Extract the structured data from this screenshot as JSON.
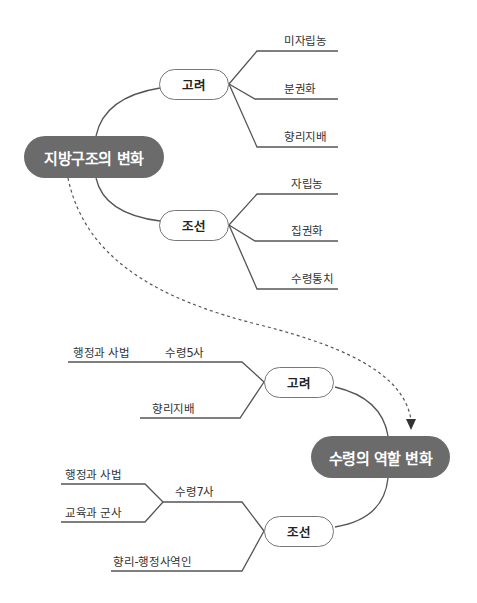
{
  "maps": [
    {
      "root": "지방구조의 변화",
      "branches": [
        {
          "label": "고려",
          "leaves": [
            "미자립농",
            "분권화",
            "향리지배"
          ]
        },
        {
          "label": "조선",
          "leaves": [
            "자립농",
            "집권화",
            "수령통치"
          ]
        }
      ]
    },
    {
      "root": "수령의 역할 변화",
      "branches": [
        {
          "label": "고려",
          "sub": {
            "label": "수령5사",
            "leaves": [
              "행정과 사법"
            ]
          },
          "leaves": [
            "향리지배"
          ]
        },
        {
          "label": "조선",
          "sub": {
            "label": "수령7사",
            "leaves": [
              "행정과 사법",
              "교육과 군사"
            ]
          },
          "leaves": [
            "향리-행정사역인"
          ]
        }
      ]
    }
  ],
  "colors": {
    "root_fill": "#6b6b6b",
    "line": "#555555",
    "node_border": "#777777"
  },
  "connector": {
    "style": "dashed",
    "from": "지방구조의 변화",
    "to": "수령의 역할 변화",
    "arrow": "arrowhead-down"
  }
}
